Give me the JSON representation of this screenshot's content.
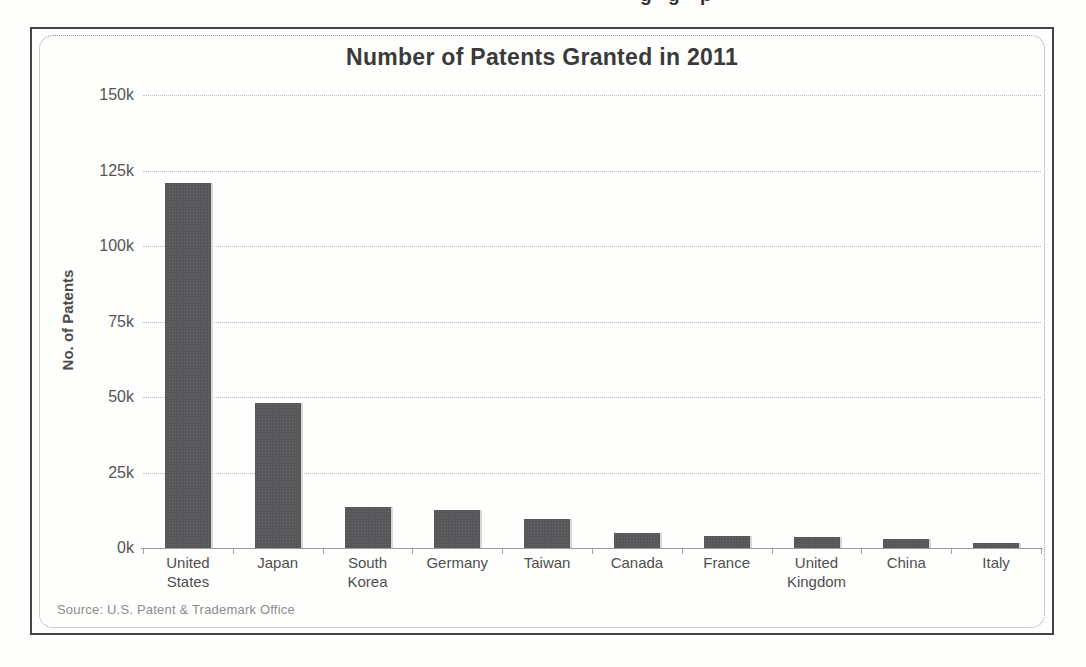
{
  "window": {
    "top_cropped_fragment_glyphs": [
      "g",
      "g",
      "p"
    ]
  },
  "chart": {
    "title": "Number of Patents Granted in 2011",
    "y_axis_title": "No. of Patents",
    "source_note": "Source: U.S. Patent & Trademark Office"
  },
  "chart_data": {
    "type": "bar",
    "title": "Number of Patents Granted in 2011",
    "xlabel": "",
    "ylabel": "No. of Patents",
    "categories": [
      "United States",
      "Japan",
      "South Korea",
      "Germany",
      "Taiwan",
      "Canada",
      "France",
      "United Kingdom",
      "China",
      "Italy"
    ],
    "values": [
      121000,
      48000,
      13500,
      12500,
      9500,
      5000,
      4000,
      3600,
      3000,
      1500
    ],
    "ylim": [
      0,
      150000
    ],
    "ytick_step": 25000,
    "ytick_labels": [
      "0k",
      "25k",
      "50k",
      "75k",
      "100k",
      "125k",
      "150k"
    ],
    "grid": true,
    "legend_position": "none",
    "source": "Source: U.S. Patent & Trademark Office",
    "colors": {
      "bar": "#57575a",
      "bar_highlight": "#d8d8d4",
      "gridline": "#bcbcbc",
      "axis": "#9c9c9c",
      "title_text": "#3a3a3a",
      "label_text": "#4f4f4f",
      "source_text": "#8c8c8c"
    }
  }
}
